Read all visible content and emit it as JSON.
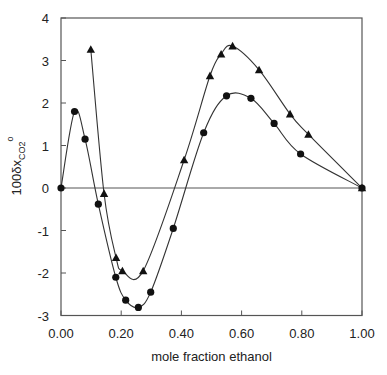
{
  "chart_data": {
    "type": "line",
    "title": "",
    "xlabel": "mole fraction ethanol",
    "ylabel": "100δx",
    "ylabel_sub": "CO2",
    "ylabel_sup": "o",
    "xlim": [
      0,
      1
    ],
    "ylim": [
      -3,
      4
    ],
    "x_ticks": [
      0.0,
      0.2,
      0.4,
      0.6,
      0.8,
      1.0
    ],
    "x_tick_labels": [
      "0.00",
      "0.20",
      "0.40",
      "0.60",
      "0.80",
      "1.00"
    ],
    "y_ticks": [
      -3,
      -2,
      -1,
      0,
      1,
      2,
      3,
      4
    ],
    "y_tick_labels": [
      "-3",
      "-2",
      "-1",
      "0",
      "1",
      "2",
      "3",
      "4"
    ],
    "grid": false,
    "zero_line": true,
    "legend": null,
    "series": [
      {
        "name": "circles",
        "marker": "circle",
        "x": [
          0.0,
          0.045,
          0.08,
          0.124,
          0.182,
          0.215,
          0.257,
          0.298,
          0.373,
          0.474,
          0.55,
          0.631,
          0.708,
          0.796,
          1.0
        ],
        "y": [
          0.0,
          1.8,
          1.15,
          -0.38,
          -2.1,
          -2.64,
          -2.81,
          -2.45,
          -0.95,
          1.3,
          2.17,
          2.11,
          1.52,
          0.8,
          0.0
        ]
      },
      {
        "name": "triangles",
        "marker": "triangle",
        "x": [
          0.099,
          0.143,
          0.183,
          0.204,
          0.273,
          0.409,
          0.495,
          0.532,
          0.57,
          0.658,
          0.761,
          0.822,
          1.0
        ],
        "y": [
          3.26,
          -0.13,
          -1.64,
          -1.95,
          -1.95,
          0.66,
          2.64,
          3.15,
          3.34,
          2.78,
          1.74,
          1.26,
          0.0
        ]
      }
    ]
  },
  "colors": {
    "line": "#333333",
    "marker": "#111111",
    "axis": "#555555",
    "background": "#ffffff"
  }
}
